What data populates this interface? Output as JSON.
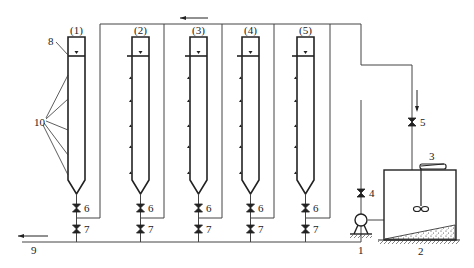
{
  "diagram": {
    "type": "process-flow",
    "columns": [
      {
        "id": "col-1",
        "label": "(1)",
        "x": 68
      },
      {
        "id": "col-2",
        "label": "(2)",
        "x": 132
      },
      {
        "id": "col-3",
        "label": "(3)",
        "x": 190
      },
      {
        "id": "col-4",
        "label": "(4)",
        "x": 242
      },
      {
        "id": "col-5",
        "label": "(5)",
        "x": 297
      }
    ],
    "labels": {
      "pump": "1",
      "tank": "2",
      "mixer": "3",
      "valve_4": "4",
      "valve_5": "5",
      "valve_6": "6",
      "valve_7": "7",
      "drain": "9",
      "sampling_ports": "10",
      "overflow": "8"
    },
    "colors": {
      "line": "#333333",
      "background": "#ffffff"
    }
  }
}
